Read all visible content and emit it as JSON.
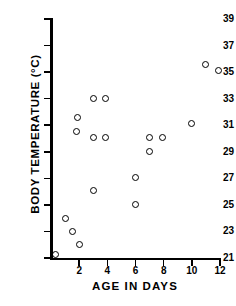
{
  "chart_data": {
    "type": "scatter",
    "title": "",
    "xlabel": "AGE IN DAYS",
    "ylabel": "BODY TEMPERATURE (°C)",
    "xlim": [
      0,
      12
    ],
    "ylim": [
      21,
      39
    ],
    "xticks": [
      2,
      4,
      6,
      8,
      10,
      12
    ],
    "xticklabels": [
      "2",
      "4",
      "6",
      "8",
      "10",
      "12"
    ],
    "yticks": [
      21,
      23,
      25,
      27,
      29,
      31,
      33,
      35,
      37,
      39
    ],
    "yticklabels": [
      "21",
      "23",
      "25",
      "27",
      "29",
      "31",
      "33",
      "35",
      "37",
      "39"
    ],
    "grid": false,
    "legend": null,
    "marker": "open-circle",
    "series": [
      {
        "name": "body temperature vs age",
        "points": [
          {
            "x": 0.3,
            "y": 21.3
          },
          {
            "x": 1.0,
            "y": 24.0
          },
          {
            "x": 1.5,
            "y": 23.0
          },
          {
            "x": 2.0,
            "y": 22.0
          },
          {
            "x": 1.9,
            "y": 31.6
          },
          {
            "x": 1.8,
            "y": 30.5
          },
          {
            "x": 3.0,
            "y": 33.0
          },
          {
            "x": 3.9,
            "y": 33.0
          },
          {
            "x": 3.0,
            "y": 30.1
          },
          {
            "x": 3.9,
            "y": 30.1
          },
          {
            "x": 3.0,
            "y": 26.1
          },
          {
            "x": 6.0,
            "y": 27.1
          },
          {
            "x": 6.0,
            "y": 25.0
          },
          {
            "x": 7.0,
            "y": 30.1
          },
          {
            "x": 7.9,
            "y": 30.1
          },
          {
            "x": 7.0,
            "y": 29.0
          },
          {
            "x": 10.0,
            "y": 31.1
          },
          {
            "x": 11.0,
            "y": 35.6
          },
          {
            "x": 11.9,
            "y": 35.1
          }
        ]
      }
    ]
  }
}
